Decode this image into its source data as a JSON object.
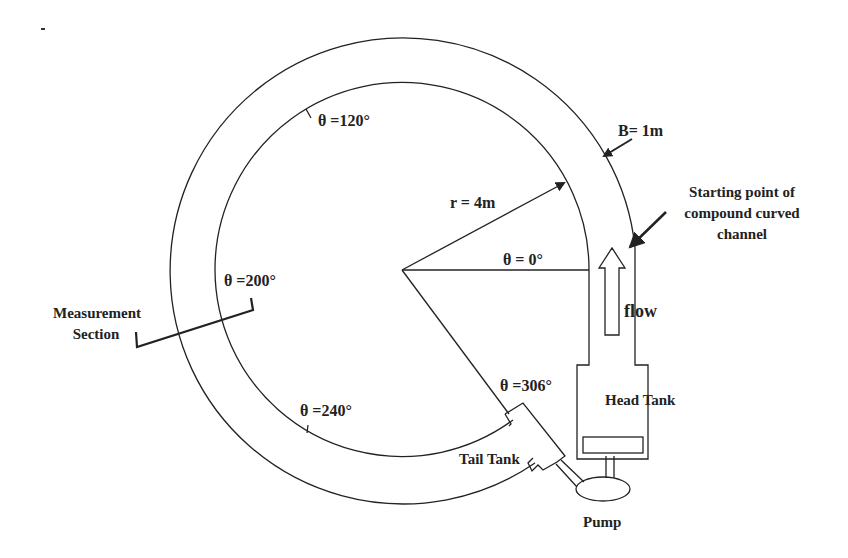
{
  "diagram": {
    "type": "schematic",
    "labels": {
      "theta_120": "θ =120°",
      "theta_200": "θ =200°",
      "theta_240": "θ =240°",
      "theta_306": "θ =306°",
      "theta_0": "θ = 0°",
      "radius": "r = 4m",
      "width": "B= 1m",
      "start_line1": "Starting point of",
      "start_line2": "compound curved",
      "start_line3": "channel",
      "measurement_line1": "Measurement",
      "measurement_line2": "Section",
      "flow": "flow",
      "head_tank": "Head Tank",
      "tail_tank": "Tail Tank",
      "pump": "Pump"
    },
    "parameters": {
      "inner_radius_m": 4,
      "channel_width_m": 1,
      "start_angle_deg": 0,
      "end_angle_deg": 306,
      "marked_angles_deg": [
        0,
        120,
        200,
        240,
        306
      ],
      "measurement_section_deg": 200
    },
    "colors": {
      "line": "#222222",
      "background": "#ffffff"
    }
  }
}
